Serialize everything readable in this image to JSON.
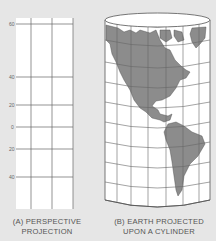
{
  "figure": {
    "panel_a": {
      "caption_line1": "(A) PERSPECTIVE",
      "caption_line2": "PROJECTION",
      "latitude_labels": [
        "60",
        "40",
        "20",
        "0",
        "20",
        "40"
      ]
    },
    "panel_b": {
      "caption_line1": "(B) EARTH PROJECTED",
      "caption_line2": "UPON A CYLINDER"
    },
    "colors": {
      "background": "#e6e6e6",
      "paper": "#ffffff",
      "land": "#8c8c8c",
      "grid": "#555555"
    }
  }
}
